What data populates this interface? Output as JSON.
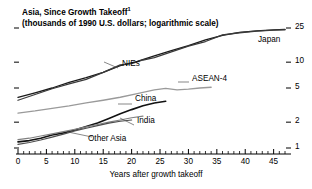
{
  "chart_data": {
    "type": "line",
    "title": "Asia, Since Growth Takeoff",
    "title_footnote_marker": "1",
    "subtitle": "(thousands of 1990 U.S. dollars; logarithmic scale)",
    "xlabel": "Years after growth takeoff",
    "ylabel": "",
    "yscale": "log",
    "ylim": [
      1,
      28
    ],
    "xlim": [
      0,
      47
    ],
    "ytick_labels": [
      "25",
      "10",
      "5",
      "2",
      "1"
    ],
    "ytick_values": [
      25,
      10,
      5,
      2,
      1
    ],
    "xtick_labels": [
      "0",
      "5",
      "10",
      "15",
      "20",
      "25",
      "30",
      "35",
      "40",
      "45"
    ],
    "xtick_values": [
      0,
      5,
      10,
      15,
      20,
      25,
      30,
      35,
      40,
      45
    ],
    "x_minor_step": 1,
    "grid": false,
    "legend": "inline-labels",
    "series": [
      {
        "name": "Japan",
        "color": "#1a1a1a",
        "width": 1.3,
        "x": [
          0,
          3,
          6,
          9,
          12,
          15,
          18,
          21,
          24,
          27,
          30,
          33,
          36,
          39,
          42,
          45,
          47
        ],
        "values": [
          3.9,
          4.4,
          5.0,
          5.8,
          6.6,
          7.6,
          9.1,
          10.2,
          11.8,
          13.6,
          15.6,
          18.2,
          20.5,
          22.2,
          23.2,
          23.8,
          24.0
        ]
      },
      {
        "name": "NIEs",
        "color": "#3a3a3a",
        "width": 1.3,
        "x": [
          0,
          3,
          6,
          9,
          12,
          15,
          18,
          20,
          22,
          24,
          27,
          30,
          33,
          36,
          39,
          42,
          45,
          47
        ],
        "values": [
          3.6,
          4.2,
          4.9,
          5.6,
          6.3,
          7.6,
          9.3,
          9.6,
          10.6,
          11.3,
          13.2,
          15.4,
          17.4,
          20.8,
          22.0,
          23.0,
          23.6,
          23.9
        ]
      },
      {
        "name": "ASEAN-4",
        "color": "#9a9a9a",
        "width": 1.3,
        "x": [
          0,
          3,
          6,
          9,
          12,
          15,
          18,
          21,
          24,
          26,
          28,
          30,
          32,
          34
        ],
        "values": [
          2.55,
          2.7,
          2.9,
          3.1,
          3.35,
          3.6,
          3.9,
          4.3,
          4.75,
          4.95,
          4.75,
          4.85,
          5.0,
          5.1
        ]
      },
      {
        "name": "China",
        "color": "#111111",
        "width": 1.6,
        "x": [
          0,
          2,
          4,
          6,
          8,
          10,
          12,
          14,
          16,
          18,
          20,
          22,
          24,
          26
        ],
        "values": [
          1.18,
          1.22,
          1.3,
          1.42,
          1.5,
          1.62,
          1.78,
          1.95,
          2.2,
          2.5,
          2.8,
          3.1,
          3.35,
          3.5
        ]
      },
      {
        "name": "India",
        "color": "#808080",
        "width": 1.2,
        "x": [
          0,
          2,
          4,
          6,
          8,
          10,
          12,
          14,
          16,
          18,
          20,
          22
        ],
        "values": [
          1.25,
          1.3,
          1.38,
          1.46,
          1.55,
          1.65,
          1.76,
          1.88,
          2.0,
          2.12,
          2.25,
          2.35
        ]
      },
      {
        "name": "Other Asia",
        "color": "#4d4d4d",
        "width": 1.2,
        "x": [
          0,
          2,
          4,
          6,
          8,
          10,
          12,
          14,
          16,
          18,
          20
        ],
        "values": [
          1.1,
          1.16,
          1.24,
          1.34,
          1.45,
          1.58,
          1.7,
          1.82,
          1.95,
          2.05,
          2.12
        ]
      }
    ],
    "annotations": [
      {
        "text": "Japan",
        "x_px": 258,
        "y_px": 41
      },
      {
        "text": "NIEs",
        "x_px": 122,
        "y_px": 65
      },
      {
        "text": "ASEAN-4",
        "x_px": 192,
        "y_px": 80
      },
      {
        "text": "China",
        "x_px": 135,
        "y_px": 100
      },
      {
        "text": "India",
        "x_px": 137,
        "y_px": 122
      },
      {
        "text": "Other Asia",
        "x_px": 88,
        "y_px": 140
      }
    ]
  }
}
